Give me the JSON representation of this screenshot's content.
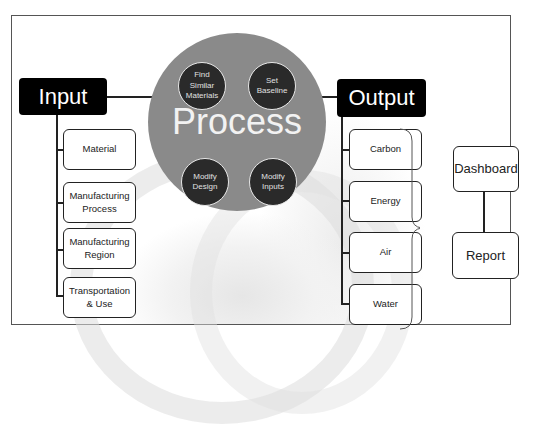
{
  "input": {
    "title": "Input",
    "items": [
      {
        "label": "Material"
      },
      {
        "label": "Manufacturing\nProcess"
      },
      {
        "label": "Manufacturing\nRegion"
      },
      {
        "label": "Transportation\n& Use"
      }
    ]
  },
  "process": {
    "title": "Process",
    "steps": [
      {
        "label": "Find\nSimilar\nMaterials"
      },
      {
        "label": "Set\nBaseline"
      },
      {
        "label": "Modify\nDesign"
      },
      {
        "label": "Modify\nInputs"
      }
    ]
  },
  "output": {
    "title": "Output",
    "items": [
      {
        "label": "Carbon"
      },
      {
        "label": "Energy"
      },
      {
        "label": "Air"
      },
      {
        "label": "Water"
      }
    ]
  },
  "deliverables": {
    "dashboard": "Dashboard",
    "report": "Report"
  },
  "colors": {
    "header_bg": "#000000",
    "process_circle": "#8a8a8a",
    "process_step": "#2a2a2a"
  }
}
